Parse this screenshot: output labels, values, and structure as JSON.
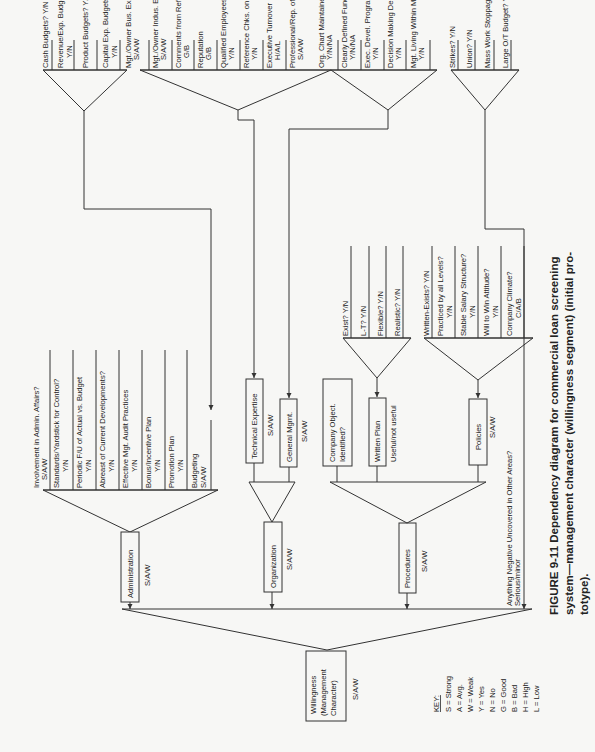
{
  "figure": {
    "caption_line1": "FIGURE 9-11   Dependency diagram for commercial loan screening",
    "caption_line2": "system—management character (willingness segment) (initial pro-",
    "caption_line3": "totype)."
  },
  "root": {
    "label_1": "Willingness",
    "label_2": "(Management",
    "label_3": "Character)",
    "scale": "S/A/W"
  },
  "branches": {
    "administration": {
      "label": "Administration",
      "scale": "S/A/W"
    },
    "organization": {
      "label": "Organization",
      "scale": "S/A/W"
    },
    "procedures": {
      "label": "Procedures",
      "scale": "S/A/W"
    },
    "other_areas": {
      "label": "Anything Negative Uncovered in Other Areas?",
      "scale": "Serious/minor"
    }
  },
  "administration_factors": [
    {
      "label": "Involvement in Admin. Affairs?",
      "scale": "S/A/W"
    },
    {
      "label": "Standards/Yardstick for Control?",
      "scale": "Y/N"
    },
    {
      "label": "Periodic F/U of Actual vs. Budget",
      "scale": "Y/N"
    },
    {
      "label": "Abreast of Current Developments?",
      "scale": "Y/N"
    },
    {
      "label": "Effective Mgt. Audit Practices",
      "scale": "Y/N"
    },
    {
      "label": "Bonus/Incentive Plan",
      "scale": "Y/N"
    },
    {
      "label": "Promotion Plan",
      "scale": "Y/N"
    },
    {
      "label": "Budgeting",
      "scale": "S/A/W"
    }
  ],
  "budget_factors": [
    {
      "label": "Cash Budgets? Y/N",
      "scale": ""
    },
    {
      "label": "Revenue/Exp. Budgets",
      "scale": "Y/N"
    },
    {
      "label": "Product Budgets? Y/N",
      "scale": ""
    },
    {
      "label": "Capital Exp. Budgets",
      "scale": "Y/N"
    }
  ],
  "organization_factors": {
    "technical": {
      "label": "Technical Expertise",
      "scale": "S/A/W"
    },
    "general": {
      "label": "General Mgmt.",
      "scale": "S/A/W"
    }
  },
  "technical_factors": [
    {
      "label": "Mgt./Owner Bus. Exper.?",
      "scale": "S/A/W"
    },
    {
      "label": "Mgt./Owner Indus. Exper.?",
      "scale": "S/A/W"
    },
    {
      "label": "Comments from References/Chks.",
      "scale": "G/B"
    },
    {
      "label": "Reputation",
      "scale": "G/B"
    },
    {
      "label": "Qualified Employees?",
      "scale": "Y/N"
    },
    {
      "label": "Reference Chks. on Employees?",
      "scale": "Y/N"
    },
    {
      "label": "Executive Turnover",
      "scale": "H/A/L"
    },
    {
      "label": "Professional/Rep. of Mgt. Staff?",
      "scale": "S/A/W"
    }
  ],
  "general_mgmt_factors": [
    {
      "label": "Org. Chart Maintained?",
      "scale": "Y/N/NA"
    },
    {
      "label": "Clearly Defined Functions?",
      "scale": "Y/N/NA"
    },
    {
      "label": "Exec. Devel. Program?",
      "scale": "Y/N"
    },
    {
      "label": "Decision Making Delegated?",
      "scale": "Y/N"
    },
    {
      "label": "Mgt. Living Within Means?",
      "scale": "Y/N"
    }
  ],
  "procedures_factors": {
    "objectives": {
      "label_1": "Company Object.",
      "label_2": "Identified?"
    },
    "written_plan": {
      "label": "Written Plan",
      "scale": "Useful/not useful"
    },
    "policies": {
      "label": "Policies",
      "scale": "S/A/W"
    }
  },
  "written_plan_factors": [
    {
      "label": "Exist? Y/N"
    },
    {
      "label": "L-T? Y/N"
    },
    {
      "label": "Flexible? Y/N"
    },
    {
      "label": "Realistic? Y/N"
    }
  ],
  "policies_factors": [
    {
      "label": "Written-Exists? Y/N",
      "scale": ""
    },
    {
      "label": "Practiced by all Levels?",
      "scale": "Y/N"
    },
    {
      "label": "Stable Salary Structure?",
      "scale": "Y/N"
    },
    {
      "label": "Will to Win Attitude?",
      "scale": "Y/N"
    },
    {
      "label": "Company Climate?",
      "scale": "C/A/B"
    }
  ],
  "labor_factors": [
    {
      "label": "Strikes? Y/N"
    },
    {
      "label": "Union? Y/N"
    },
    {
      "label": "Mass Work Stoppages? Y/N"
    },
    {
      "label": "Large O/T Budget? Y/N"
    }
  ],
  "key": {
    "title": "KEY:",
    "items": [
      "S = Strong",
      "A = Avg.",
      "W = Weak",
      "Y = Yes",
      "N = No",
      "G = Good",
      "B = Bad",
      "H = High",
      "L = Low"
    ]
  }
}
